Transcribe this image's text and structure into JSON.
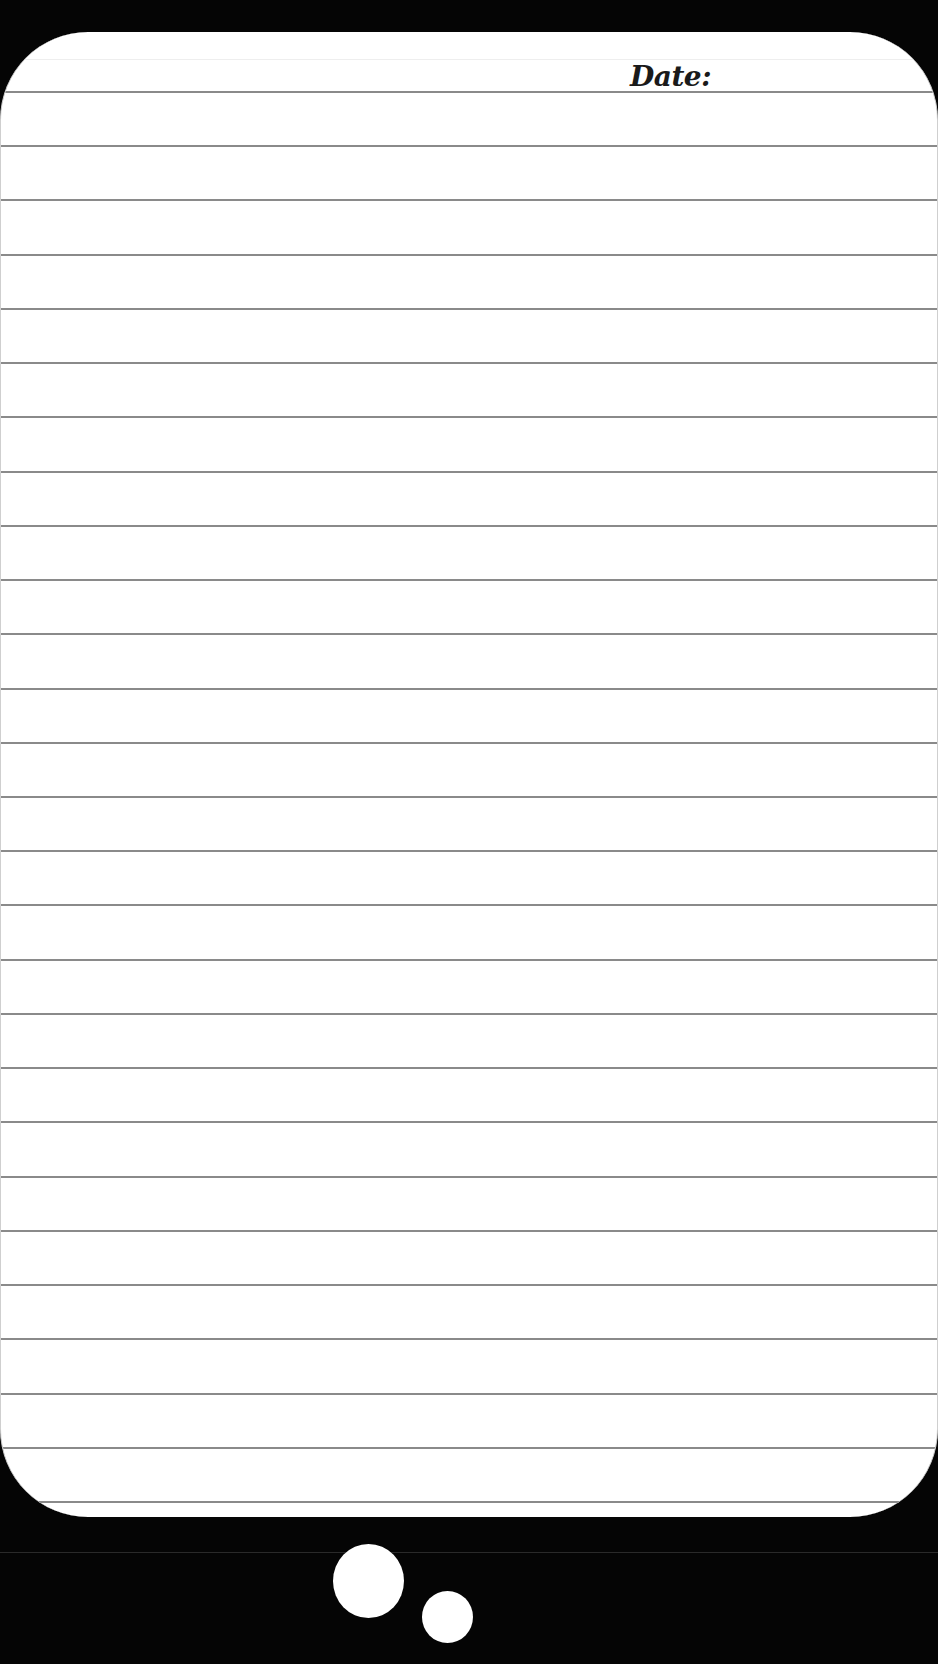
{
  "page": {
    "background_color": "#000000",
    "card_color": "#ffffff",
    "rule_color": "#8a8a8a"
  },
  "header": {
    "date_label": "Date:"
  },
  "ruled_lines": {
    "count": 27,
    "first_line_y": 92,
    "spacing_px": 54.23
  },
  "decorations": {
    "thought_bubbles": [
      {
        "name": "large-bubble",
        "cx": 368,
        "cy": 1581,
        "r": 36
      },
      {
        "name": "small-bubble",
        "cx": 447,
        "cy": 1617,
        "r": 26
      }
    ]
  }
}
